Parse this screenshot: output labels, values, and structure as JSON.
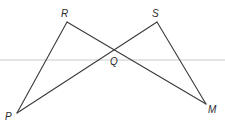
{
  "diagram": {
    "type": "geometry-figure",
    "points": [
      {
        "id": "R",
        "label": "R",
        "x": 67,
        "y": 22,
        "label_x": 61,
        "label_y": 17
      },
      {
        "id": "S",
        "label": "S",
        "x": 157,
        "y": 22,
        "label_x": 152,
        "label_y": 17
      },
      {
        "id": "Q",
        "label": "Q",
        "x": 114,
        "y": 50,
        "label_x": 110,
        "label_y": 65
      },
      {
        "id": "P",
        "label": "P",
        "x": 17,
        "y": 113,
        "label_x": 5,
        "label_y": 120
      },
      {
        "id": "M",
        "label": "M",
        "x": 206,
        "y": 104,
        "label_x": 208,
        "label_y": 113
      }
    ],
    "segments": [
      {
        "from": "P",
        "to": "R"
      },
      {
        "from": "R",
        "to": "M"
      },
      {
        "from": "P",
        "to": "S"
      },
      {
        "from": "S",
        "to": "M"
      }
    ],
    "line_color": "#3a3a3a"
  }
}
